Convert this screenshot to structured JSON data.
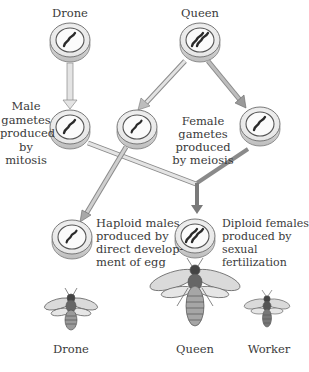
{
  "parents": {
    "drone": {
      "label": "Drone",
      "chromosome_sets": 1
    },
    "queen": {
      "label": "Queen",
      "chromosome_sets": 2
    }
  },
  "gametes": {
    "male_label": [
      "Male",
      "gametes",
      "produced",
      "by",
      "mitosis"
    ],
    "female_label": [
      "Female gametes",
      "produced",
      "by meiosis"
    ]
  },
  "offspring": {
    "haploid_label": [
      "Haploid males",
      "produced by",
      "direct develop-",
      "ment of egg"
    ],
    "diploid_label": [
      "Diploid females",
      "produced by",
      "sexual fertilization"
    ]
  },
  "bees": [
    {
      "label": "Drone"
    },
    {
      "label": "Queen"
    },
    {
      "label": "Worker"
    }
  ],
  "colors": {
    "arrow_light": "#d8d8d8",
    "arrow_dark": "#8a8a8a",
    "disc_outline": "#6b6b6b",
    "chromosome": "#2a2a2a"
  }
}
